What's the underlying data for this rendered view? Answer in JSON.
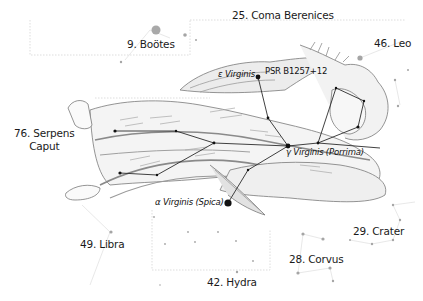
{
  "colors": {
    "background": "#ffffff",
    "figure_line": "#2b2b2b",
    "star_main": "#111111",
    "star_faint": "#9a9a9a",
    "boundary": "#c9c9c9",
    "illustration_shade": "#bdbdbd",
    "illustration_line": "#777777"
  },
  "neighbor_constellations": [
    {
      "id": "bootes",
      "label": "9. Boötes"
    },
    {
      "id": "coma",
      "label": "25. Coma Berenices"
    },
    {
      "id": "leo",
      "label": "46. Leo"
    },
    {
      "id": "serpens",
      "label_line1": "76. Serpens",
      "label_line2": "Caput"
    },
    {
      "id": "libra",
      "label": "49. Libra"
    },
    {
      "id": "hydra",
      "label": "42. Hydra"
    },
    {
      "id": "corvus",
      "label": "28. Corvus"
    },
    {
      "id": "crater",
      "label": "29. Crater"
    }
  ],
  "named_stars": {
    "epsilon": {
      "greek": "ε",
      "name": "Virginis"
    },
    "pulsar": {
      "name": "PSR B1257+12"
    },
    "gamma": {
      "greek": "γ",
      "name": "Virginis (Porrima)"
    },
    "alpha": {
      "greek": "α",
      "name": "Virginis (Spica)"
    }
  }
}
